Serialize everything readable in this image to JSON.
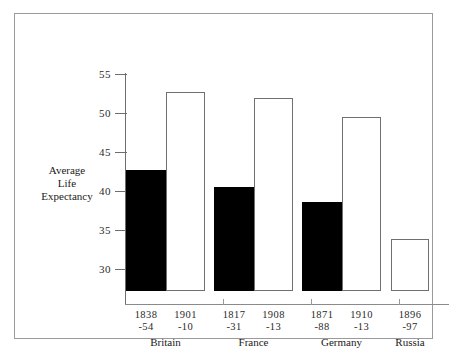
{
  "chart_data": {
    "type": "bar",
    "title": "",
    "xlabel": "",
    "ylabel": "Average Life Expectancy",
    "ylabel_lines": [
      "Average",
      "Life",
      "Expectancy"
    ],
    "ylim": [
      25.5,
      55
    ],
    "yticks": [
      55,
      50,
      45,
      40,
      35,
      30
    ],
    "ytick_labels": [
      "55",
      "50",
      "45",
      "40",
      "35",
      "30"
    ],
    "grid": false,
    "legend": "none",
    "categories": [
      "1838-54",
      "1901-10",
      "1817-31",
      "1908-13",
      "1871-88",
      "1910-13",
      "1896-97"
    ],
    "values": [
      41.0,
      51.0,
      38.8,
      50.3,
      36.9,
      47.8,
      32.2
    ],
    "groups": [
      "Britain",
      "France",
      "Germany",
      "Russia"
    ],
    "bars": [
      {
        "group": "Britain",
        "year_top": "1838",
        "year_bottom": "-54",
        "value": 41.0,
        "style": "filled"
      },
      {
        "group": "Britain",
        "year_top": "1901",
        "year_bottom": "-10",
        "value": 51.0,
        "style": "open"
      },
      {
        "group": "France",
        "year_top": "1817",
        "year_bottom": "-31",
        "value": 38.8,
        "style": "filled"
      },
      {
        "group": "France",
        "year_top": "1908",
        "year_bottom": "-13",
        "value": 50.3,
        "style": "open"
      },
      {
        "group": "Germany",
        "year_top": "1871",
        "year_bottom": "-88",
        "value": 36.9,
        "style": "filled"
      },
      {
        "group": "Germany",
        "year_top": "1910",
        "year_bottom": "-13",
        "value": 47.8,
        "style": "open"
      },
      {
        "group": "Russia",
        "year_top": "1896",
        "year_bottom": "-97",
        "value": 32.2,
        "style": "open"
      }
    ],
    "colors": {
      "filled_bar": "#000000",
      "open_bar_fill": "#ffffff",
      "open_bar_border": "#707070",
      "axis": "#6e6e6e",
      "frame": "#9a9a9a",
      "text": "#1a1a1a",
      "background": "#ffffff"
    }
  }
}
